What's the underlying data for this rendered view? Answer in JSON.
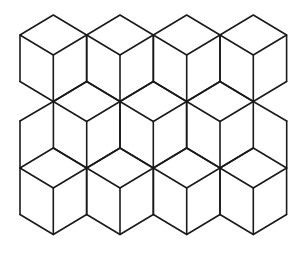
{
  "figure": {
    "stroke_color": "#1a1a1a",
    "background": "#ffffff",
    "geometry": {
      "half_width": 33.3,
      "rhombus_half_height": 20,
      "vertical_edge": 46.5
    },
    "cube_rows": [
      {
        "name": "row-1",
        "top_y": 15,
        "centers_x": [
          53.3,
          120,
          186.7,
          253.3
        ]
      },
      {
        "name": "row-2",
        "top_y": 81.5,
        "centers_x": [
          86.7,
          153.3,
          220
        ]
      },
      {
        "name": "row-3",
        "top_y": 148,
        "centers_x": [
          53.3,
          120,
          186.7,
          253.3
        ]
      }
    ],
    "edge_fragments": [
      {
        "name": "left-upper-join",
        "points": [
          [
            20,
            121
          ],
          [
            53.3,
            101.5
          ]
        ]
      },
      {
        "name": "left-middle-vertical",
        "points": [
          [
            20,
            121
          ],
          [
            20,
            168
          ]
        ]
      },
      {
        "name": "right-upper-join",
        "points": [
          [
            286.7,
            121
          ],
          [
            253.3,
            101.5
          ]
        ]
      },
      {
        "name": "right-middle-vertical",
        "points": [
          [
            286.7,
            121
          ],
          [
            286.7,
            168
          ]
        ]
      }
    ]
  }
}
